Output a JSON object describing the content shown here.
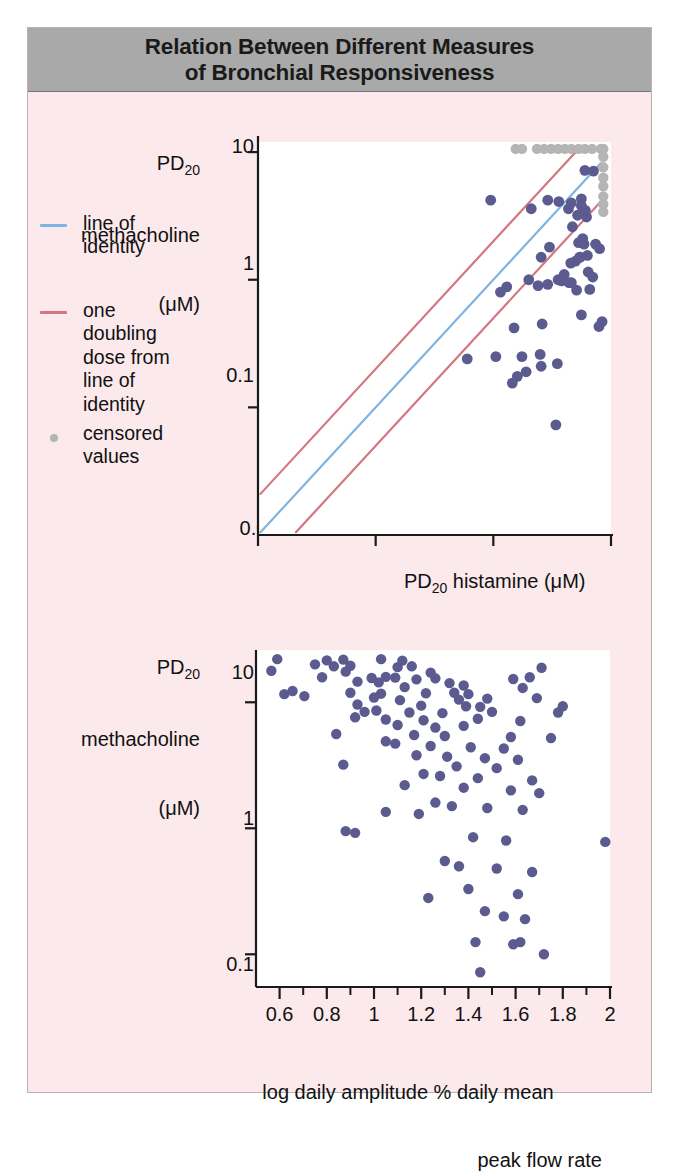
{
  "figure": {
    "title_line1": "Relation Between Different Measures",
    "title_line2": "of Bronchial Responsiveness",
    "background_color": "#fbe9ec",
    "title_bar_color": "#a9a9a9",
    "border_color": "#b9b2b4"
  },
  "colors": {
    "point": "#5b5b8f",
    "censored_point": "#b5b5b5",
    "identity_line": "#7eb4e2",
    "doubling_line": "#d4767f",
    "axis": "#1a1a1a",
    "plot_background": "#ffffff"
  },
  "legend": {
    "items": [
      {
        "label": "line of\nidentity",
        "marker": "line",
        "color": "#7eb4e2"
      },
      {
        "label": "one\ndoubling\ndose from\nline of\nidentity",
        "marker": "line",
        "color": "#d4767f"
      },
      {
        "label": "censored\nvalues",
        "marker": "dot",
        "color": "#b5b5b5"
      }
    ]
  },
  "chart_data": [
    {
      "id": "top-chart",
      "type": "scatter",
      "title": "",
      "xlabel": "PD20 histamine (μM)",
      "xlabel_parts": {
        "pre": "PD",
        "sub": "20",
        "post": " histamine (μM)"
      },
      "ylabel": "PD20 methacholine (μM)",
      "ylabel_lines": [
        "PD20",
        "methacholine",
        "(μM)"
      ],
      "xscale": "log",
      "yscale": "log",
      "xlim": [
        0.01,
        10
      ],
      "ylim": [
        0.01,
        12
      ],
      "xticks": [
        0.01,
        0.1,
        1,
        10
      ],
      "xticklabels": [
        "0.01",
        "0.1",
        "1",
        "10"
      ],
      "yticks": [
        0.1,
        1,
        10
      ],
      "yticklabels": [
        "0.1",
        "1",
        "10"
      ],
      "grid": false,
      "legend_position": "outside-left",
      "lines": [
        {
          "name": "line of identity",
          "color": "#7eb4e2",
          "from": [
            0.0105,
            0.0105
          ],
          "to": [
            8.2,
            8.2
          ]
        },
        {
          "name": "one doubling dose above",
          "color": "#d4767f",
          "from": [
            0.0105,
            0.021
          ],
          "to": [
            5.2,
            10.4
          ]
        },
        {
          "name": "one doubling dose below",
          "color": "#d4767f",
          "from": [
            0.021,
            0.0105
          ],
          "to": [
            8.2,
            4.1
          ]
        }
      ],
      "points": [
        [
          0.95,
          4.2
        ],
        [
          2.1,
          3.6
        ],
        [
          2.9,
          4.2
        ],
        [
          3.6,
          4.1
        ],
        [
          4.6,
          4.0
        ],
        [
          6.0,
          7.2
        ],
        [
          7.1,
          7.1
        ],
        [
          5.6,
          4.3
        ],
        [
          5.6,
          3.8
        ],
        [
          5.2,
          3.2
        ],
        [
          6.2,
          3.1
        ],
        [
          4.7,
          2.6
        ],
        [
          5.3,
          1.95
        ],
        [
          7.4,
          1.9
        ],
        [
          5.9,
          1.9
        ],
        [
          8.0,
          1.75
        ],
        [
          6.3,
          1.55
        ],
        [
          5.4,
          1.5
        ],
        [
          2.55,
          1.5
        ],
        [
          3.0,
          1.8
        ],
        [
          4.55,
          1.35
        ],
        [
          5.0,
          1.4
        ],
        [
          5.5,
          1.5
        ],
        [
          4.0,
          1.1
        ],
        [
          7.0,
          1.05
        ],
        [
          3.8,
          0.98
        ],
        [
          4.4,
          0.95
        ],
        [
          4.6,
          0.95
        ],
        [
          2.9,
          0.92
        ],
        [
          2.4,
          0.9
        ],
        [
          1.3,
          0.88
        ],
        [
          1.15,
          0.8
        ],
        [
          5.1,
          0.83
        ],
        [
          6.6,
          0.84
        ],
        [
          5.6,
          0.53
        ],
        [
          8.4,
          0.47
        ],
        [
          7.9,
          0.43
        ],
        [
          2.6,
          0.45
        ],
        [
          1.5,
          0.42
        ],
        [
          2.5,
          0.26
        ],
        [
          1.75,
          0.25
        ],
        [
          2.55,
          0.21
        ],
        [
          3.5,
          0.22
        ],
        [
          1.9,
          0.19
        ],
        [
          0.6,
          0.24
        ],
        [
          1.05,
          0.25
        ],
        [
          1.45,
          0.155
        ],
        [
          3.4,
          0.073
        ],
        [
          1.6,
          0.175
        ],
        [
          4.35,
          3.6
        ],
        [
          6.05,
          3.5
        ],
        [
          5.75,
          2.1
        ],
        [
          6.4,
          1.15
        ],
        [
          2.0,
          1.0
        ],
        [
          3.55,
          1.0
        ]
      ],
      "censored_points_top": [
        [
          1.55,
          10.6
        ],
        [
          1.75,
          10.6
        ],
        [
          2.35,
          10.6
        ],
        [
          2.7,
          10.6
        ],
        [
          3.1,
          10.6
        ],
        [
          3.55,
          10.6
        ],
        [
          4.05,
          10.6
        ],
        [
          4.6,
          10.6
        ],
        [
          5.3,
          10.6
        ],
        [
          6.0,
          10.6
        ],
        [
          6.9,
          10.6
        ],
        [
          8.2,
          10.6
        ]
      ],
      "censored_points_right": [
        [
          8.6,
          10.6
        ],
        [
          8.6,
          9.2
        ],
        [
          8.6,
          7.6
        ],
        [
          8.6,
          6.3
        ],
        [
          8.6,
          5.4
        ],
        [
          8.6,
          4.5
        ],
        [
          8.6,
          3.9
        ],
        [
          8.6,
          3.4
        ]
      ]
    },
    {
      "id": "bottom-chart",
      "type": "scatter",
      "title": "",
      "xlabel_lines": [
        "log daily amplitude % daily mean",
        "peak flow rate"
      ],
      "ylabel": "PD20 methacholine (μM)",
      "ylabel_lines": [
        "PD20",
        "methacholine",
        "(μM)"
      ],
      "xscale": "linear",
      "yscale": "log",
      "xlim": [
        0.5,
        2.0
      ],
      "ylim": [
        0.055,
        26
      ],
      "xticks": [
        0.6,
        0.8,
        1.0,
        1.2,
        1.4,
        1.6,
        1.8,
        2.0
      ],
      "xticklabels": [
        "0.6",
        "0.8",
        "1",
        "1.2",
        "1.4",
        "1.6",
        "1.8",
        "2"
      ],
      "xminorticks": [
        0.7,
        0.9,
        1.1,
        1.3,
        1.5,
        1.7,
        1.9
      ],
      "yticks": [
        0.1,
        1,
        10
      ],
      "yticklabels": [
        "0.1",
        "1",
        "10"
      ],
      "grid": false,
      "points": [
        [
          0.59,
          22.0
        ],
        [
          0.8,
          21.5
        ],
        [
          0.87,
          21.8
        ],
        [
          1.03,
          22.0
        ],
        [
          1.12,
          21.4
        ],
        [
          0.75,
          20.0
        ],
        [
          0.83,
          19.3
        ],
        [
          0.9,
          19.5
        ],
        [
          1.1,
          19.0
        ],
        [
          1.16,
          19.3
        ],
        [
          0.565,
          17.8
        ],
        [
          0.88,
          17.5
        ],
        [
          1.71,
          18.8
        ],
        [
          1.24,
          17.2
        ],
        [
          0.78,
          15.8
        ],
        [
          0.99,
          15.6
        ],
        [
          1.05,
          15.9
        ],
        [
          1.09,
          15.7
        ],
        [
          1.18,
          15.2
        ],
        [
          1.26,
          15.5
        ],
        [
          1.59,
          15.3
        ],
        [
          1.66,
          15.8
        ],
        [
          0.93,
          14.6
        ],
        [
          1.02,
          14.4
        ],
        [
          1.32,
          14.2
        ],
        [
          1.38,
          13.6
        ],
        [
          1.13,
          13.2
        ],
        [
          1.63,
          13.0
        ],
        [
          0.655,
          12.3
        ],
        [
          0.62,
          11.6
        ],
        [
          0.9,
          11.9
        ],
        [
          1.03,
          11.7
        ],
        [
          1.22,
          11.8
        ],
        [
          1.34,
          11.9
        ],
        [
          1.4,
          11.6
        ],
        [
          0.705,
          11.2
        ],
        [
          1.0,
          10.9
        ],
        [
          1.11,
          10.4
        ],
        [
          1.36,
          10.5
        ],
        [
          1.48,
          10.7
        ],
        [
          1.69,
          10.8
        ],
        [
          0.93,
          9.6
        ],
        [
          1.2,
          9.4
        ],
        [
          1.39,
          9.3
        ],
        [
          1.45,
          9.2
        ],
        [
          1.8,
          9.3
        ],
        [
          0.96,
          8.4
        ],
        [
          1.01,
          8.6
        ],
        [
          1.15,
          8.3
        ],
        [
          1.29,
          8.2
        ],
        [
          1.5,
          8.4
        ],
        [
          1.78,
          8.3
        ],
        [
          0.92,
          7.6
        ],
        [
          1.05,
          7.3
        ],
        [
          1.21,
          7.2
        ],
        [
          1.44,
          7.4
        ],
        [
          1.62,
          7.1
        ],
        [
          1.1,
          6.6
        ],
        [
          1.38,
          6.5
        ],
        [
          1.26,
          6.3
        ],
        [
          0.84,
          5.6
        ],
        [
          1.17,
          5.5
        ],
        [
          1.3,
          5.4
        ],
        [
          1.58,
          5.3
        ],
        [
          1.75,
          5.2
        ],
        [
          1.05,
          4.9
        ],
        [
          1.09,
          4.7
        ],
        [
          1.24,
          4.5
        ],
        [
          1.41,
          4.4
        ],
        [
          1.55,
          4.3
        ],
        [
          1.18,
          3.8
        ],
        [
          1.31,
          3.7
        ],
        [
          1.47,
          3.6
        ],
        [
          1.61,
          3.5
        ],
        [
          0.87,
          3.2
        ],
        [
          1.35,
          3.1
        ],
        [
          1.52,
          3.0
        ],
        [
          1.21,
          2.7
        ],
        [
          1.28,
          2.6
        ],
        [
          1.44,
          2.5
        ],
        [
          1.67,
          2.4
        ],
        [
          1.13,
          2.2
        ],
        [
          1.38,
          2.1
        ],
        [
          1.58,
          2.0
        ],
        [
          1.7,
          1.9
        ],
        [
          1.26,
          1.6
        ],
        [
          1.33,
          1.5
        ],
        [
          1.48,
          1.45
        ],
        [
          1.63,
          1.4
        ],
        [
          1.05,
          1.35
        ],
        [
          1.19,
          1.3
        ],
        [
          0.88,
          0.95
        ],
        [
          0.92,
          0.92
        ],
        [
          1.42,
          0.85
        ],
        [
          1.56,
          0.8
        ],
        [
          1.98,
          0.78
        ],
        [
          1.3,
          0.55
        ],
        [
          1.36,
          0.5
        ],
        [
          1.52,
          0.48
        ],
        [
          1.67,
          0.45
        ],
        [
          1.4,
          0.33
        ],
        [
          1.61,
          0.3
        ],
        [
          1.23,
          0.28
        ],
        [
          1.47,
          0.22
        ],
        [
          1.55,
          0.2
        ],
        [
          1.64,
          0.19
        ],
        [
          1.43,
          0.125
        ],
        [
          1.59,
          0.12
        ],
        [
          1.62,
          0.125
        ],
        [
          1.72,
          0.1
        ],
        [
          1.45,
          0.072
        ]
      ]
    }
  ]
}
